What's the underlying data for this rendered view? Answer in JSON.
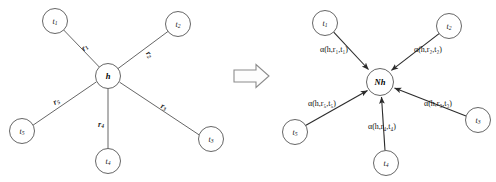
{
  "figure": {
    "transform_arrow": "rightwards-double-arrow",
    "colors": {
      "node_stroke": "#555555",
      "node_fill": "#ffffff",
      "edge_stroke": "#555555",
      "arrow_stroke": "#2b2b2b",
      "text": "#1a1a1a",
      "background": "#ffffff",
      "big_arrow_stroke": "#8c8c8c"
    }
  },
  "left_graph": {
    "name": "neighborhood-star-graph",
    "center": {
      "id": "h",
      "label": "h",
      "cx": 108,
      "cy": 76,
      "r": 12.5
    },
    "tails": [
      {
        "id": "t1",
        "base": "t",
        "sub": "1",
        "cx": 55,
        "cy": 21,
        "r": 12.5
      },
      {
        "id": "t2",
        "base": "t",
        "sub": "2",
        "cx": 178,
        "cy": 24,
        "r": 12.5
      },
      {
        "id": "t3",
        "base": "t",
        "sub": "3",
        "cx": 211,
        "cy": 139,
        "r": 12.5
      },
      {
        "id": "t4",
        "base": "t",
        "sub": "4",
        "cx": 108,
        "cy": 161,
        "r": 12.5
      },
      {
        "id": "t5",
        "base": "t",
        "sub": "5",
        "cx": 22,
        "cy": 131,
        "r": 12.5
      }
    ],
    "relations": [
      {
        "id": "r1",
        "base": "r",
        "sub": "1",
        "x": 84,
        "y": 47,
        "rotate": -43
      },
      {
        "id": "r2",
        "base": "r",
        "sub": "2",
        "x": 150,
        "y": 54,
        "rotate": 52
      },
      {
        "id": "r3",
        "base": "r",
        "sub": "3",
        "x": 164,
        "y": 106,
        "rotate": 22
      },
      {
        "id": "r4",
        "base": "r",
        "sub": "4",
        "x": 101,
        "y": 124,
        "rotate": 0
      },
      {
        "id": "r5",
        "base": "r",
        "sub": "5",
        "x": 56,
        "y": 101,
        "rotate": -29
      }
    ]
  },
  "right_graph": {
    "name": "attention-aggregation-graph",
    "center": {
      "id": "Nh",
      "label": "Nh",
      "cx": 380,
      "cy": 82,
      "r": 13.5
    },
    "tails": [
      {
        "id": "t1",
        "base": "t",
        "sub": "1",
        "cx": 325,
        "cy": 23,
        "r": 12.5
      },
      {
        "id": "t2",
        "base": "t",
        "sub": "2",
        "cx": 449,
        "cy": 26,
        "r": 12.5
      },
      {
        "id": "t3",
        "base": "t",
        "sub": "3",
        "cx": 478,
        "cy": 120,
        "r": 12.5
      },
      {
        "id": "t4",
        "base": "t",
        "sub": "4",
        "cx": 386,
        "cy": 163,
        "r": 12.5
      },
      {
        "id": "t5",
        "base": "t",
        "sub": "5",
        "cx": 295,
        "cy": 132,
        "r": 12.5
      }
    ],
    "attention_labels": [
      {
        "id": "a1",
        "fn": "α",
        "args": [
          "h",
          "r",
          "t"
        ],
        "sub": "1",
        "text": "α(h,r₁,t₁)",
        "x": 334,
        "y": 49,
        "rotate": 0
      },
      {
        "id": "a2",
        "fn": "α",
        "args": [
          "h",
          "r",
          "t"
        ],
        "sub": "2",
        "text": "α(h,r₂,t₂)",
        "x": 428,
        "y": 49,
        "rotate": 0
      },
      {
        "id": "a3",
        "fn": "α",
        "args": [
          "h",
          "r",
          "t"
        ],
        "sub": "3",
        "text": "α(h,r₃,t₃)",
        "x": 438,
        "y": 103,
        "rotate": 0
      },
      {
        "id": "a4",
        "fn": "α",
        "args": [
          "h",
          "r",
          "t"
        ],
        "sub": "4",
        "text": "α(h,r₄,t₄)",
        "x": 382,
        "y": 126,
        "rotate": 0
      },
      {
        "id": "a5",
        "fn": "α",
        "args": [
          "h",
          "r",
          "t"
        ],
        "sub": "5",
        "text": "α(h,r₅,t₅)",
        "x": 322,
        "y": 103,
        "rotate": 0
      }
    ]
  }
}
